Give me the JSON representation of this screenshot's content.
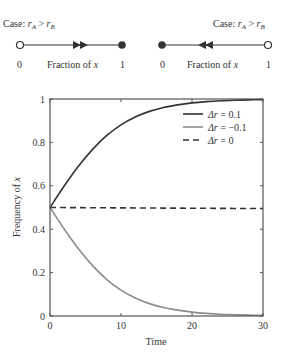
{
  "phase_diagrams": [
    {
      "case_label": "Case: ",
      "r_a": "r",
      "sub_a": "A",
      "gt": " > ",
      "r_b": "r",
      "sub_b": "B",
      "left_tick": "0",
      "right_tick": "1",
      "axis_label_prefix": "Fraction of ",
      "axis_label_var": "x",
      "open_end": "left",
      "filled_end": "right",
      "arrow_direction": "right"
    },
    {
      "case_label": "Case: ",
      "r_a": "r",
      "sub_a": "A",
      "gt": " > ",
      "r_b": "r",
      "sub_b": "B",
      "left_tick": "0",
      "right_tick": "1",
      "axis_label_prefix": "Fraction of ",
      "axis_label_var": "x",
      "open_end": "right",
      "filled_end": "left",
      "arrow_direction": "left"
    }
  ],
  "chart_data": {
    "type": "line",
    "title": "",
    "xlabel": "Time",
    "ylabel_prefix": "Frequency of ",
    "ylabel_var": "x",
    "xlim": [
      0,
      30
    ],
    "ylim": [
      0,
      1
    ],
    "xticks": [
      0,
      10,
      20,
      30
    ],
    "xtick_labels": [
      "0",
      "10",
      "20",
      "30"
    ],
    "yticks": [
      0,
      0.2,
      0.4,
      0.6,
      0.8,
      1
    ],
    "ytick_labels": [
      "0",
      "0.2",
      "0.4",
      "0.6",
      "0.8",
      "1"
    ],
    "grid": false,
    "legend_position": "upper right",
    "x": [
      0,
      2,
      4,
      6,
      8,
      10,
      12,
      14,
      16,
      18,
      20,
      22,
      24,
      26,
      28,
      30
    ],
    "series": [
      {
        "name": "Δr = 0.1",
        "legend_var": "Δr",
        "legend_val": " = 0.1",
        "color": "#333333",
        "dash": "",
        "values": [
          0.5,
          0.599,
          0.69,
          0.768,
          0.832,
          0.881,
          0.917,
          0.943,
          0.961,
          0.973,
          0.982,
          0.988,
          0.992,
          0.994,
          0.996,
          0.997
        ]
      },
      {
        "name": "Δr = −0.1",
        "legend_var": "Δr",
        "legend_val": " = −0.1",
        "color": "#8c8c8c",
        "dash": "",
        "values": [
          0.5,
          0.401,
          0.31,
          0.232,
          0.168,
          0.119,
          0.083,
          0.057,
          0.039,
          0.027,
          0.018,
          0.012,
          0.008,
          0.006,
          0.004,
          0.003
        ]
      },
      {
        "name": "Δr = 0",
        "legend_var": "Δr",
        "legend_val": " = 0",
        "color": "#333333",
        "dash": "6,4",
        "values": [
          0.5,
          0.4997,
          0.4993,
          0.499,
          0.4987,
          0.4983,
          0.498,
          0.4977,
          0.4973,
          0.497,
          0.4967,
          0.4963,
          0.496,
          0.4957,
          0.4953,
          0.495
        ]
      }
    ]
  }
}
